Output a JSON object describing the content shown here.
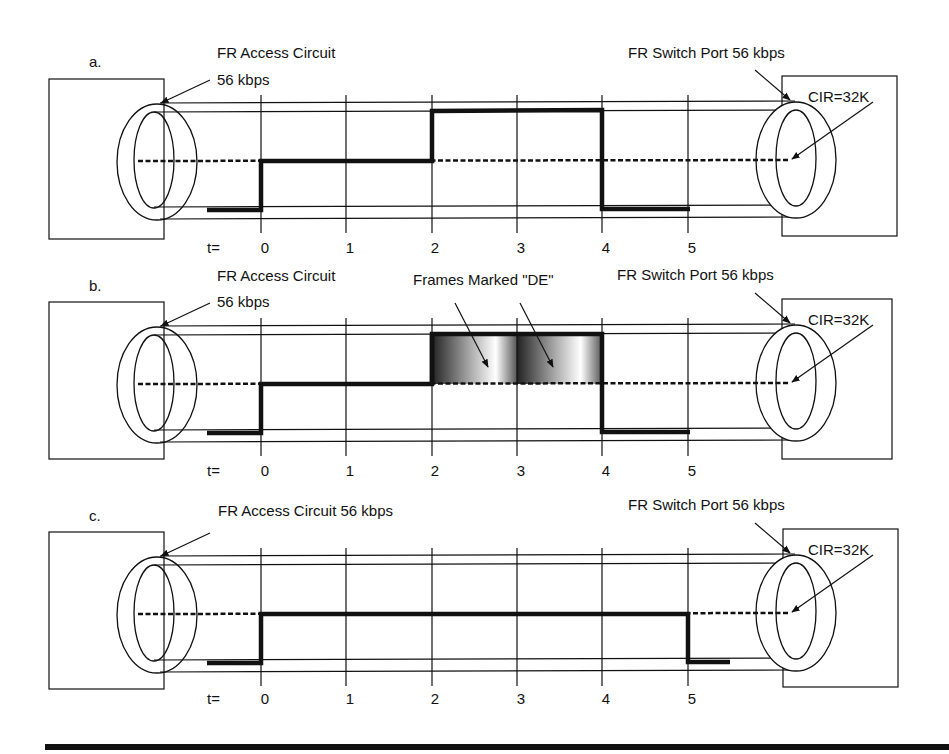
{
  "panels": [
    {
      "id": "a",
      "label": "a.",
      "access_circuit_label_line1": "FR Access Circuit",
      "access_circuit_label_line2": "56 kbps",
      "switch_port_label": "FR Switch Port 56 kbps",
      "cir_label": "CIR=32K",
      "time_prefix": "t=",
      "ticks": [
        "0",
        "1",
        "2",
        "3",
        "4",
        "5"
      ],
      "signal": "low until t=0, CIR level t=0..2, burst 56k t=2..4, low t=4..5"
    },
    {
      "id": "b",
      "label": "b.",
      "access_circuit_label_line1": "FR Access Circuit",
      "access_circuit_label_line2": "56 kbps",
      "switch_port_label": "FR Switch Port 56 kbps",
      "cir_label": "CIR=32K",
      "de_label": "Frames Marked \"DE\"",
      "time_prefix": "t=",
      "ticks": [
        "0",
        "1",
        "2",
        "3",
        "4",
        "5"
      ],
      "signal": "low until t=0, CIR level t=0..2, burst above CIR t=2..4 marked DE, low t=4..5"
    },
    {
      "id": "c",
      "label": "c.",
      "access_circuit_label_line1": "FR Access Circuit 56 kbps",
      "access_circuit_label_line2": "",
      "switch_port_label": "FR Switch Port 56 kbps",
      "cir_label": "CIR=32K",
      "time_prefix": "t=",
      "ticks": [
        "0",
        "1",
        "2",
        "3",
        "4",
        "5"
      ],
      "signal": "low until t=0, CIR level t=0..5, low after t=5"
    }
  ],
  "colors": {
    "line": "#111111",
    "background": "#ffffff"
  }
}
